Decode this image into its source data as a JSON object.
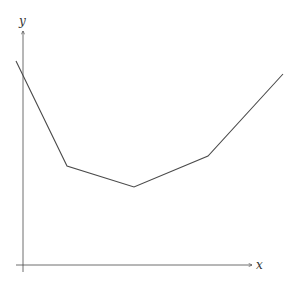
{
  "chart_data": {
    "type": "line",
    "title": "",
    "xlabel": "x",
    "ylabel": "y",
    "grid": false,
    "legend": null,
    "ticks": {
      "x": [],
      "y": []
    },
    "xlim": [
      0,
      10
    ],
    "ylim": [
      0,
      10
    ],
    "series": [
      {
        "name": "piecewise linear",
        "x": [
          -0.3,
          1.9,
          4.8,
          8.0,
          11.2
        ],
        "y": [
          8.6,
          4.1,
          3.3,
          4.5,
          8.0
        ]
      }
    ],
    "pixel_points": [
      [
        16,
        61
      ],
      [
        67,
        166
      ],
      [
        134,
        187
      ],
      [
        208,
        156
      ],
      [
        283,
        74
      ]
    ]
  },
  "axes": {
    "x_label": "x",
    "y_label": "y",
    "color": "#4a4a4a"
  }
}
